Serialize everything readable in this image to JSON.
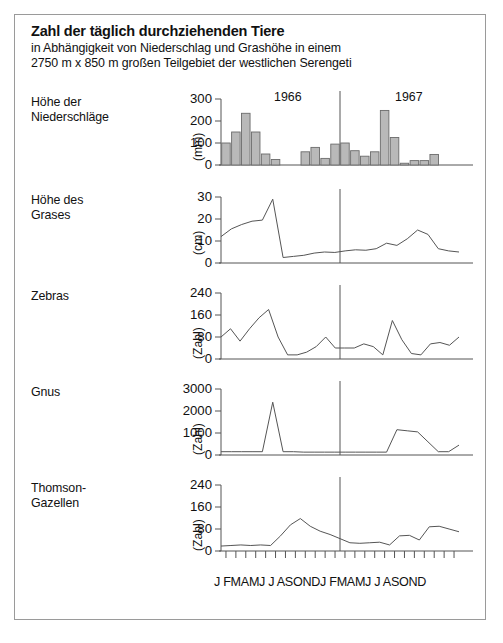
{
  "header": {
    "title": "Zahl der täglich durchziehenden Tiere",
    "subtitle_line1": "in Abhängigkeit von Niederschlag und Grashöhe in einem",
    "subtitle_line2": "2750 m x 850 m großen Teilgebiet der westlichen Serengeti"
  },
  "axis": {
    "year_left": "1966",
    "year_right": "1967",
    "month_labels": [
      "J",
      "F",
      "M",
      "A",
      "M",
      "J",
      "J",
      "A",
      "S",
      "O",
      "N",
      "D",
      "J",
      "F",
      "M",
      "A",
      "M",
      "J",
      "J",
      "A",
      "S",
      "O",
      "N",
      "D"
    ],
    "xtick_row": "J FMAMJ J ASONDJ FMAMJ J ASOND"
  },
  "colors": {
    "ink": "#111111",
    "line": "#555555",
    "bar_fill": "#b9b9b9",
    "bar_stroke": "#6b6b6b",
    "frame": "#9a9a9a"
  },
  "chart_data": [
    {
      "type": "bar",
      "panel_label": "Höhe der\nNiederschläge",
      "ylabel": "(mm)",
      "title": "Höhe der Niederschläge",
      "categories": [
        "J",
        "F",
        "M",
        "A",
        "M",
        "J",
        "J",
        "A",
        "S",
        "O",
        "N",
        "D",
        "J",
        "F",
        "M",
        "A",
        "M",
        "J",
        "J",
        "A",
        "S",
        "O",
        "N",
        "D"
      ],
      "values": [
        100,
        150,
        235,
        150,
        50,
        25,
        0,
        0,
        60,
        80,
        30,
        95,
        100,
        65,
        40,
        60,
        248,
        125,
        8,
        20,
        20,
        48,
        0,
        0
      ],
      "yticks": [
        0,
        100,
        200,
        300
      ],
      "ylim": [
        0,
        300
      ],
      "grid": false
    },
    {
      "type": "line",
      "panel_label": "Höhe des\nGrases",
      "ylabel": "(cm)",
      "title": "Höhe des Grases",
      "categories": [
        "J",
        "F",
        "M",
        "A",
        "M",
        "J",
        "J",
        "A",
        "S",
        "O",
        "N",
        "D",
        "J",
        "F",
        "M",
        "A",
        "M",
        "J",
        "J",
        "A",
        "S",
        "O",
        "N",
        "D"
      ],
      "values": [
        12,
        15.5,
        17.5,
        19,
        19.5,
        29,
        2.5,
        3,
        3.5,
        4.5,
        5,
        4.8,
        5.5,
        6,
        5.8,
        6.5,
        9,
        8,
        11,
        15,
        13,
        6.5,
        5.5,
        5
      ],
      "yticks": [
        0,
        10,
        20,
        30
      ],
      "ylim": [
        0,
        30
      ],
      "grid": false
    },
    {
      "type": "line",
      "panel_label": "Zebras",
      "ylabel": "(Zahl)",
      "title": "Zebras",
      "categories": [
        "J",
        "F",
        "M",
        "A",
        "M",
        "J",
        "J",
        "A",
        "S",
        "O",
        "N",
        "D",
        "J",
        "F",
        "M",
        "A",
        "M",
        "J",
        "J",
        "A",
        "S",
        "O",
        "N",
        "D"
      ],
      "values": [
        80,
        110,
        65,
        110,
        150,
        180,
        80,
        15,
        15,
        25,
        45,
        80,
        40,
        40,
        40,
        55,
        45,
        15,
        140,
        70,
        20,
        15,
        55,
        60,
        50,
        80
      ],
      "values_monthly": [
        80,
        110,
        65,
        150,
        180,
        80,
        15,
        15,
        25,
        45,
        80,
        40,
        40,
        55,
        45,
        15,
        140,
        40,
        20,
        15,
        55,
        70,
        55,
        80
      ],
      "yticks": [
        0,
        80,
        160,
        240
      ],
      "ylim": [
        0,
        240
      ],
      "grid": false
    },
    {
      "type": "line",
      "panel_label": "Gnus",
      "ylabel": "(Zahl)",
      "title": "Gnus",
      "categories": [
        "J",
        "F",
        "M",
        "A",
        "M",
        "J",
        "J",
        "A",
        "S",
        "O",
        "N",
        "D",
        "J",
        "F",
        "M",
        "A",
        "M",
        "J",
        "J",
        "A",
        "S",
        "O",
        "N",
        "D"
      ],
      "values": [
        150,
        150,
        150,
        150,
        150,
        2400,
        150,
        150,
        130,
        130,
        130,
        130,
        130,
        130,
        130,
        130,
        130,
        1150,
        1100,
        1050,
        600,
        150,
        150,
        450
      ],
      "yticks": [
        0,
        1000,
        2000,
        3000
      ],
      "ylim": [
        0,
        3000
      ],
      "grid": false
    },
    {
      "type": "line",
      "panel_label": "Thomson-\nGazellen",
      "ylabel": "(Zahl)",
      "title": "Thomson-Gazellen",
      "categories": [
        "J",
        "F",
        "M",
        "A",
        "M",
        "J",
        "J",
        "A",
        "S",
        "O",
        "N",
        "D",
        "J",
        "F",
        "M",
        "A",
        "M",
        "J",
        "J",
        "A",
        "S",
        "O",
        "N",
        "D"
      ],
      "values": [
        18,
        20,
        22,
        20,
        22,
        20,
        55,
        95,
        118,
        90,
        72,
        60,
        45,
        30,
        28,
        30,
        32,
        22,
        55,
        57,
        40,
        88,
        90,
        80,
        70
      ],
      "values_monthly": [
        18,
        20,
        22,
        20,
        22,
        20,
        55,
        95,
        118,
        85,
        70,
        55,
        38,
        28,
        30,
        32,
        22,
        55,
        57,
        40,
        88,
        90,
        82,
        70
      ],
      "yticks": [
        0,
        80,
        160,
        240
      ],
      "ylim": [
        0,
        240
      ],
      "grid": false
    }
  ]
}
